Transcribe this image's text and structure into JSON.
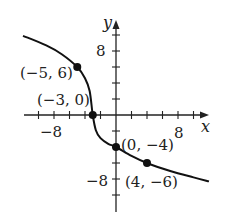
{
  "chart_data": {
    "type": "line",
    "title": "",
    "xlabel": "x",
    "ylabel": "y",
    "xlim": [
      -12,
      12
    ],
    "ylim": [
      -11,
      11
    ],
    "x_ticks_step": 2,
    "y_ticks_step": 2,
    "x_tick_labels": [
      {
        "value": -8,
        "label": "−8"
      },
      {
        "value": 8,
        "label": "8"
      }
    ],
    "y_tick_labels": [
      {
        "value": 8,
        "label": "8"
      },
      {
        "value": -8,
        "label": "−8"
      }
    ],
    "grid": false,
    "series": [
      {
        "name": "curve",
        "color": "#111111",
        "x": [
          -12,
          -9,
          -7,
          -5,
          -4,
          -3.4,
          -3,
          -2.6,
          -2,
          -1,
          0,
          2,
          4,
          7,
          10,
          12
        ],
        "y": [
          9.9,
          8.7,
          7.6,
          6,
          4.6,
          3,
          0,
          -1.9,
          -2.9,
          -3.6,
          -4,
          -5.1,
          -6,
          -7,
          -7.8,
          -8.3
        ]
      }
    ],
    "points": [
      {
        "x": -5,
        "y": 6,
        "label": "(−5, 6)"
      },
      {
        "x": -3,
        "y": 0,
        "label": "(−3, 0)"
      },
      {
        "x": 0,
        "y": -4,
        "label": "(0, −4)"
      },
      {
        "x": 4,
        "y": -6,
        "label": "(4, −6)"
      }
    ]
  }
}
